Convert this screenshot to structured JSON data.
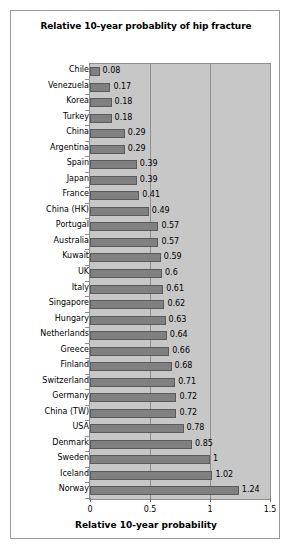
{
  "chart_data": {
    "type": "bar",
    "orientation": "horizontal",
    "title": "Relative 10-year probablity of hip fracture",
    "xlabel": "Relative 10-year probability",
    "ylabel": "",
    "xlim": [
      0,
      1.5
    ],
    "xticks": [
      "0",
      "0.5",
      "1",
      "1.5"
    ],
    "xtick_values": [
      0,
      0.5,
      1,
      1.5
    ],
    "grid": true,
    "grid_axis": "x",
    "legend": "none",
    "plot_background": "#c7c7c7",
    "bar_color": "#808080",
    "bar_border_color": "#5a5a5a",
    "categories": [
      "Chile",
      "Venezuela",
      "Korea",
      "Turkey",
      "China",
      "Argentina",
      "Spain",
      "Japan",
      "France",
      "China (HK)",
      "Portugal",
      "Australia",
      "Kuwait",
      "UK",
      "Italy",
      "Singapore",
      "Hungary",
      "Netherlands",
      "Greece",
      "Finland",
      "Switzerland",
      "Germany",
      "China (TW)",
      "USA",
      "Denmark",
      "Sweden",
      "Iceland",
      "Norway"
    ],
    "values": [
      0.08,
      0.17,
      0.18,
      0.18,
      0.29,
      0.29,
      0.39,
      0.39,
      0.41,
      0.49,
      0.57,
      0.57,
      0.59,
      0.6,
      0.61,
      0.62,
      0.63,
      0.64,
      0.66,
      0.68,
      0.71,
      0.72,
      0.72,
      0.78,
      0.85,
      1,
      1.02,
      1.24
    ],
    "value_labels": [
      "0.08",
      "0.17",
      "0.18",
      "0.18",
      "0.29",
      "0.29",
      "0.39",
      "0.39",
      "0.41",
      "0.49",
      "0.57",
      "0.57",
      "0.59",
      "0.6",
      "0.61",
      "0.62",
      "0.63",
      "0.64",
      "0.66",
      "0.68",
      "0.71",
      "0.72",
      "0.72",
      "0.78",
      "0.85",
      "1",
      "1.02",
      "1.24"
    ]
  }
}
